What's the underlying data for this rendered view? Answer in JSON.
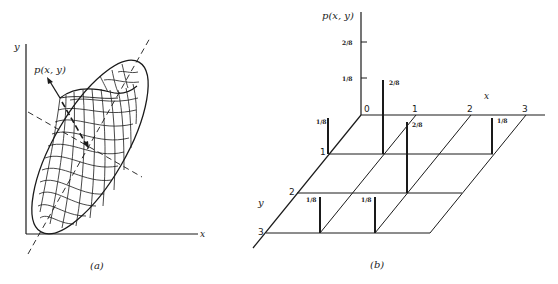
{
  "panel_a": {
    "caption": "(a)",
    "x_label": "x",
    "y_label": "y",
    "density_label": "p(x, y)",
    "description": "Bivariate normal density surface over the xy-plane, shown as a wireframe with elliptical base; dashed lines indicate principal axes"
  },
  "panel_b": {
    "caption": "(b)",
    "x_label": "x",
    "y_label": "y",
    "z_label": "p(x, y)",
    "origin_label": "0",
    "x_ticks": [
      "1",
      "2",
      "3"
    ],
    "y_ticks": [
      "1",
      "2",
      "3"
    ],
    "z_ticks": [
      "2/8",
      "1/8"
    ],
    "bars": [
      {
        "x": 0,
        "y": 1,
        "p": "1/8"
      },
      {
        "x": 1,
        "y": 0,
        "p": "2/8"
      },
      {
        "x": 3,
        "y": 1,
        "p": "1/8"
      },
      {
        "x": 2,
        "y": 1,
        "p": "2/8"
      },
      {
        "x": 0,
        "y": 3,
        "p": "1/8"
      },
      {
        "x": 1,
        "y": 3,
        "p": "1/8"
      }
    ],
    "bar_labels": {
      "b0": "1/8",
      "b1": "2/8",
      "b2": "2/8",
      "b3": "1/8",
      "b4": "1/8",
      "b5": "1/8"
    }
  }
}
